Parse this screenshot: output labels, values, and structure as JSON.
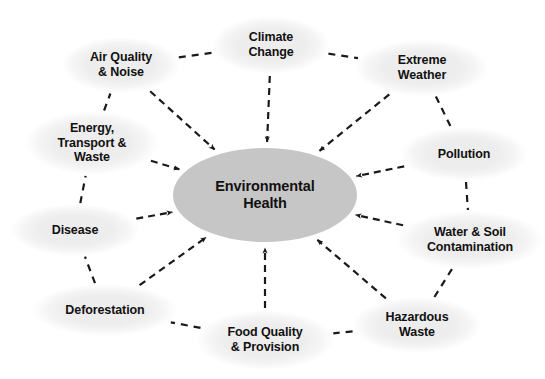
{
  "diagram": {
    "type": "concept-map",
    "title_node": {
      "id": "environmental-health",
      "label": "Environmental\nHealth",
      "fill": "#c6c6c6",
      "cx": 265,
      "cy": 195,
      "rx": 92,
      "ry": 47
    },
    "satellite_fill": "#eeeeee",
    "edge_color": "#1a1a1a",
    "edge_style": "dashed",
    "nodes": [
      {
        "id": "air-quality-noise",
        "label": "Air Quality\n& Noise",
        "cx": 121,
        "cy": 65,
        "rx": 59,
        "ry": 28
      },
      {
        "id": "climate-change",
        "label": "Climate\nChange",
        "cx": 271,
        "cy": 45,
        "rx": 59,
        "ry": 29
      },
      {
        "id": "extreme-weather",
        "label": "Extreme\nWeather",
        "cx": 422,
        "cy": 68,
        "rx": 67,
        "ry": 28
      },
      {
        "id": "pollution",
        "label": "Pollution",
        "cx": 464,
        "cy": 154,
        "rx": 64,
        "ry": 27
      },
      {
        "id": "water-soil-contamination",
        "label": "Water & Soil\nContamination",
        "cx": 470,
        "cy": 240,
        "rx": 74,
        "ry": 29
      },
      {
        "id": "hazardous-waste",
        "label": "Hazardous\nWaste",
        "cx": 417,
        "cy": 325,
        "rx": 65,
        "ry": 28
      },
      {
        "id": "food-quality-provision",
        "label": "Food Quality\n& Provision",
        "cx": 265,
        "cy": 340,
        "rx": 69,
        "ry": 30
      },
      {
        "id": "deforestation",
        "label": "Deforestation",
        "cx": 105,
        "cy": 310,
        "rx": 73,
        "ry": 26
      },
      {
        "id": "disease",
        "label": "Disease",
        "cx": 75,
        "cy": 230,
        "rx": 65,
        "ry": 26
      },
      {
        "id": "energy-transport-waste",
        "label": "Energy,\nTransport &\nWaste",
        "cx": 92,
        "cy": 143,
        "rx": 67,
        "ry": 32
      }
    ],
    "edges_to_center": [
      {
        "from": "air-quality-noise",
        "to": "environmental-health"
      },
      {
        "from": "climate-change",
        "to": "environmental-health"
      },
      {
        "from": "extreme-weather",
        "to": "environmental-health"
      },
      {
        "from": "pollution",
        "to": "environmental-health"
      },
      {
        "from": "water-soil-contamination",
        "to": "environmental-health"
      },
      {
        "from": "hazardous-waste",
        "to": "environmental-health"
      },
      {
        "from": "food-quality-provision",
        "to": "environmental-health"
      },
      {
        "from": "deforestation",
        "to": "environmental-health"
      },
      {
        "from": "disease",
        "to": "environmental-health"
      },
      {
        "from": "energy-transport-waste",
        "to": "environmental-health"
      }
    ],
    "edges_ring": [
      {
        "from": "air-quality-noise",
        "to": "climate-change"
      },
      {
        "from": "climate-change",
        "to": "extreme-weather"
      },
      {
        "from": "extreme-weather",
        "to": "pollution"
      },
      {
        "from": "pollution",
        "to": "water-soil-contamination"
      },
      {
        "from": "water-soil-contamination",
        "to": "hazardous-waste"
      },
      {
        "from": "hazardous-waste",
        "to": "food-quality-provision"
      },
      {
        "from": "food-quality-provision",
        "to": "deforestation"
      },
      {
        "from": "deforestation",
        "to": "disease"
      },
      {
        "from": "disease",
        "to": "energy-transport-waste"
      },
      {
        "from": "energy-transport-waste",
        "to": "air-quality-noise"
      }
    ]
  }
}
